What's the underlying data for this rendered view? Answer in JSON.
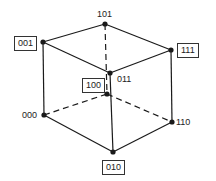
{
  "diagram": {
    "title": "",
    "vertices": [
      {
        "id": "101",
        "label": "101",
        "boxed": false
      },
      {
        "id": "001",
        "label": "001",
        "boxed": true
      },
      {
        "id": "111",
        "label": "111",
        "boxed": true
      },
      {
        "id": "011",
        "label": "011",
        "boxed": false
      },
      {
        "id": "100",
        "label": "100",
        "boxed": true
      },
      {
        "id": "000",
        "label": "000",
        "boxed": false
      },
      {
        "id": "110",
        "label": "110",
        "boxed": false
      },
      {
        "id": "010",
        "label": "010",
        "boxed": true
      }
    ],
    "edges": [
      {
        "from": "001",
        "to": "101",
        "style": "solid"
      },
      {
        "from": "101",
        "to": "111",
        "style": "solid"
      },
      {
        "from": "001",
        "to": "011",
        "style": "solid"
      },
      {
        "from": "011",
        "to": "111",
        "style": "solid"
      },
      {
        "from": "001",
        "to": "000",
        "style": "solid"
      },
      {
        "from": "111",
        "to": "110",
        "style": "solid"
      },
      {
        "from": "011",
        "to": "010",
        "style": "solid"
      },
      {
        "from": "000",
        "to": "010",
        "style": "solid"
      },
      {
        "from": "010",
        "to": "110",
        "style": "solid"
      },
      {
        "from": "101",
        "to": "100",
        "style": "dashed"
      },
      {
        "from": "000",
        "to": "100",
        "style": "dashed"
      },
      {
        "from": "100",
        "to": "110",
        "style": "dashed"
      }
    ],
    "colors": {
      "line": "#1a1a1a",
      "node": "#1a1a1a"
    }
  }
}
